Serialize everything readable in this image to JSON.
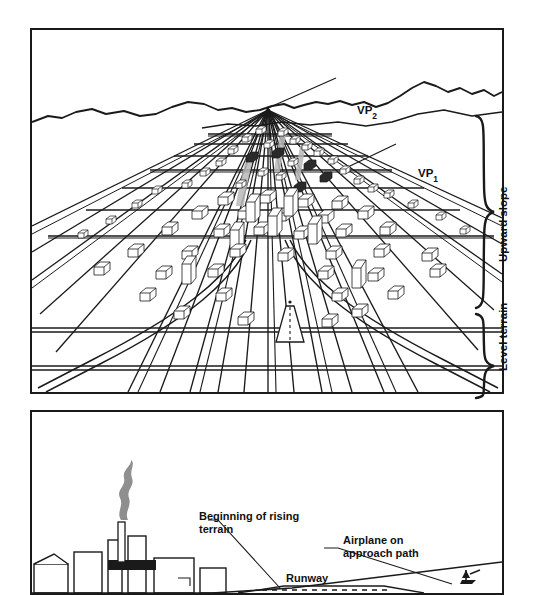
{
  "figure": {
    "panels": [
      {
        "id": "A",
        "letter": "A.",
        "labels": {
          "vp2_text": "VP",
          "vp2_sub": "2",
          "vp1_text": "VP",
          "vp1_sub": "1",
          "upward_slope": "Upward slope",
          "level_terrain": "Level terrain"
        }
      },
      {
        "id": "B",
        "letter": "B.",
        "labels": {
          "beginning_rising_terrain": "Beginning of rising terrain",
          "airplane_approach": "Airplane on approach path",
          "runway": "Runway"
        }
      }
    ],
    "colors": {
      "ink": "#1a1a1a",
      "paper": "#ffffff",
      "line": "#222222",
      "smoke": "#808080"
    }
  }
}
